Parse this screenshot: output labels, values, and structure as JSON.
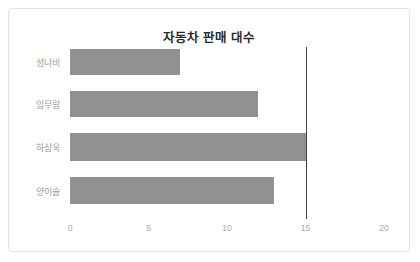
{
  "chart_data": {
    "type": "bar",
    "orientation": "horizontal",
    "title": "자동차 판매 대수",
    "xlabel": "",
    "ylabel": "",
    "categories": [
      "성나비",
      "임무람",
      "하삼욱",
      "양이슬"
    ],
    "values": [
      7,
      12,
      15,
      13
    ],
    "series": [
      {
        "name": "자동차 판매 대수",
        "values": [
          7,
          12,
          15,
          13
        ]
      }
    ],
    "xlim": [
      0,
      20
    ],
    "xticks": [
      0,
      5,
      10,
      15,
      20
    ],
    "xtick_labels": [
      "0",
      "5",
      "10",
      "15",
      "20"
    ],
    "grid": false,
    "legend": "none",
    "bar_color": "#919191",
    "reference_line": {
      "value": 15,
      "color": "#3f3f3f",
      "orientation": "vertical"
    }
  },
  "card": {
    "border_color": "#e3e3e3",
    "background": "#ffffff"
  }
}
